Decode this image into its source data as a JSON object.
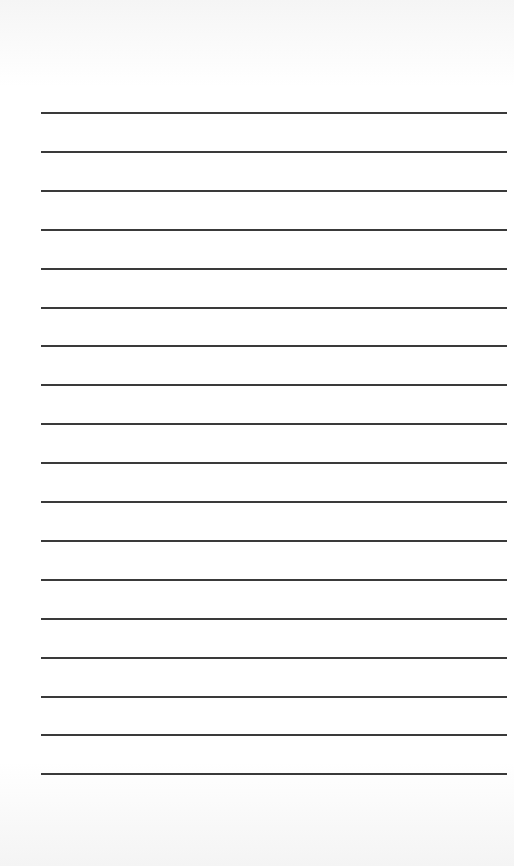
{
  "page": {
    "type": "lined-paper",
    "background_color": "#ffffff",
    "line_color": "#3a3a3a",
    "line_count": 18,
    "first_line_y": 112,
    "line_spacing": 38.9,
    "line_left": 41,
    "line_width": 466
  }
}
